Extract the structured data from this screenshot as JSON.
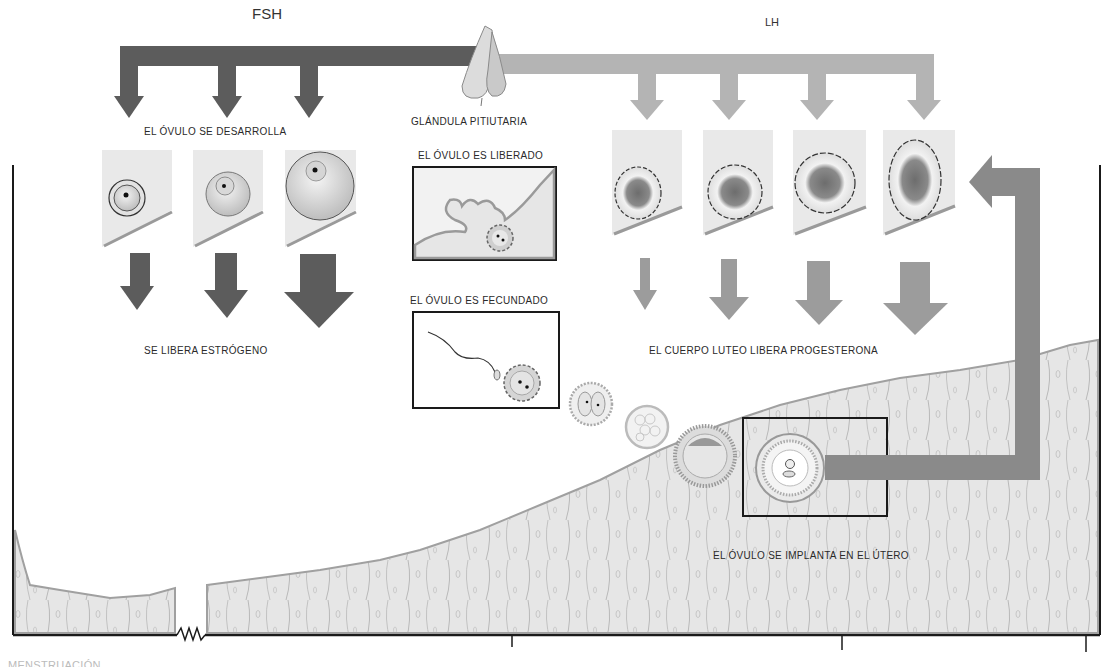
{
  "hormones": {
    "fsh": {
      "label": "FSH",
      "color": "#5c5c5c"
    },
    "lh": {
      "label": "LH",
      "color": "#b4b4b4"
    }
  },
  "gland": {
    "label": "GLÁNDULA PITIUTARIA"
  },
  "follicle_stage": {
    "label": "EL ÓVULO SE DESARROLLA",
    "panels": [
      {
        "name": "primary-follicle",
        "estrogen_arrow_size": "small"
      },
      {
        "name": "secondary-follicle",
        "estrogen_arrow_size": "medium"
      },
      {
        "name": "mature-follicle",
        "estrogen_arrow_size": "large"
      }
    ],
    "output_label": "SE LIBERA ESTRÓGENO"
  },
  "ovulation": {
    "label": "EL ÓVULO ES LIBERADO"
  },
  "fertilization": {
    "label": "EL ÓVULO ES FECUNDADO"
  },
  "corpus_luteum_stage": {
    "panels": [
      {
        "name": "corpus-luteum-1",
        "progesterone_arrow_size": "xs"
      },
      {
        "name": "corpus-luteum-2",
        "progesterone_arrow_size": "small"
      },
      {
        "name": "corpus-luteum-3",
        "progesterone_arrow_size": "medium"
      },
      {
        "name": "corpus-luteum-4",
        "progesterone_arrow_size": "large"
      }
    ],
    "output_label": "EL CUERPO LUTEO LIBERA PROGESTERONA"
  },
  "embryo_stages": [
    "two-cell",
    "morula",
    "blastocyst",
    "implanted-blastocyst"
  ],
  "implantation": {
    "label": "EL ÓVULO SE IMPLANTA EN EL ÚTERO"
  },
  "timeline": {
    "axis_break": "zigzag",
    "tick_positions_px": [
      512,
      842,
      1086
    ],
    "bottom_label_partial": "MENSTRUACIÓN"
  },
  "colors": {
    "dark_arrow": "#5c5c5c",
    "light_arrow": "#b4b4b4",
    "feedback_arrow": "#8a8a8a",
    "tissue_fill": "#e4e4e4",
    "tissue_edge": "#9a9a9a",
    "panel_fill": "#e9e9e9"
  }
}
